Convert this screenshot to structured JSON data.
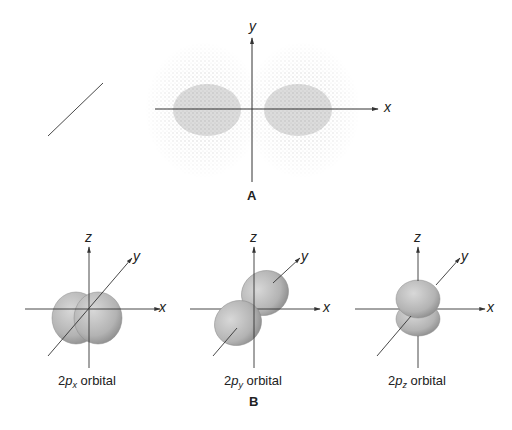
{
  "panel_a": {
    "label": "A",
    "axes": {
      "x": "x",
      "y": "y"
    },
    "description": "Electron density dot plot of a 2p orbital showing two lobes along the x axis"
  },
  "panel_b": {
    "label": "B",
    "orbitals": [
      {
        "name": "2px",
        "prefix": "2",
        "p": "p",
        "subscript": "x",
        "suffix": " orbital",
        "axes": {
          "x": "x",
          "y": "y",
          "z": "z"
        }
      },
      {
        "name": "2py",
        "prefix": "2",
        "p": "p",
        "subscript": "y",
        "suffix": " orbital",
        "axes": {
          "x": "x",
          "y": "y",
          "z": "z"
        }
      },
      {
        "name": "2pz",
        "prefix": "2",
        "p": "p",
        "subscript": "z",
        "suffix": " orbital",
        "axes": {
          "x": "x",
          "y": "y",
          "z": "z"
        }
      }
    ]
  },
  "colors": {
    "axis": "#333333",
    "dots": "#9a9a9a",
    "lobe_light": "#cfcfcf",
    "lobe_dark": "#8f8f8f"
  }
}
